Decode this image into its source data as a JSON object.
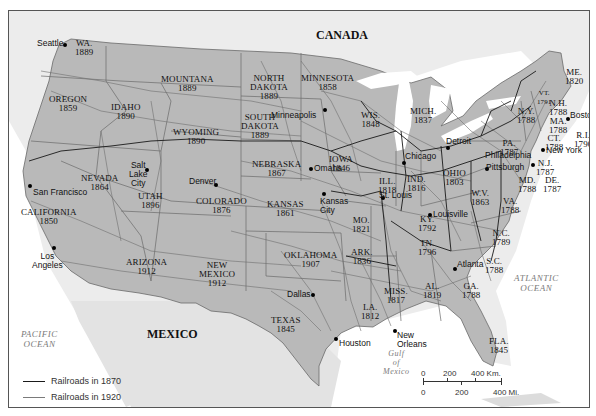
{
  "map": {
    "countries": {
      "canada": "CANADA",
      "mexico": "MEXICO"
    },
    "oceans": {
      "pacific": "PACIFIC\nOCEAN",
      "atlantic": "ATLANTIC\nOCEAN",
      "gulf": "Gulf\nof\nMexico"
    },
    "states": [
      {
        "id": "wa",
        "name": "WA.",
        "year": "1889"
      },
      {
        "id": "oregon",
        "name": "OREGON",
        "year": "1859"
      },
      {
        "id": "idaho",
        "name": "IDAHO",
        "year": "1890"
      },
      {
        "id": "montana",
        "name": "MOUNTANA",
        "year": "1889"
      },
      {
        "id": "wyoming",
        "name": "WYOMING",
        "year": "1890"
      },
      {
        "id": "north-dakota",
        "name": "NORTH\nDAKOTA",
        "year": "1889"
      },
      {
        "id": "south-dakota",
        "name": "SOUTH\nDAKOTA",
        "year": "1889"
      },
      {
        "id": "minnesota",
        "name": "MINNESOTA",
        "year": "1858"
      },
      {
        "id": "wisconsin",
        "name": "WIS.",
        "year": "1848"
      },
      {
        "id": "michigan",
        "name": "MICH.",
        "year": "1837"
      },
      {
        "id": "nevada",
        "name": "NEVADA",
        "year": "1864"
      },
      {
        "id": "utah",
        "name": "UTAH",
        "year": "1896"
      },
      {
        "id": "california",
        "name": "CALIFORNIA",
        "year": "1850"
      },
      {
        "id": "colorado",
        "name": "COLORADO",
        "year": "1876"
      },
      {
        "id": "nebraska",
        "name": "NEBRASKA",
        "year": "1867"
      },
      {
        "id": "iowa",
        "name": "IOWA",
        "year": "1846"
      },
      {
        "id": "kansas",
        "name": "KANSAS",
        "year": "1861"
      },
      {
        "id": "illinois",
        "name": "ILL.",
        "year": "1818"
      },
      {
        "id": "indiana",
        "name": "IND.",
        "year": "1816"
      },
      {
        "id": "ohio",
        "name": "OHIO",
        "year": "1803"
      },
      {
        "id": "missouri",
        "name": "MO.",
        "year": "1821"
      },
      {
        "id": "arizona",
        "name": "ARIZONA",
        "year": "1912"
      },
      {
        "id": "new-mexico",
        "name": "NEW\nMEXICO",
        "year": "1912"
      },
      {
        "id": "oklahoma",
        "name": "OKLAHOMA",
        "year": "1907"
      },
      {
        "id": "arkansas",
        "name": "ARK.",
        "year": "1836"
      },
      {
        "id": "texas",
        "name": "TEXAS",
        "year": "1845"
      },
      {
        "id": "louisiana",
        "name": "LA.",
        "year": "1812"
      },
      {
        "id": "mississippi",
        "name": "MISS.",
        "year": "1817"
      },
      {
        "id": "alabama",
        "name": "AL.",
        "year": "1819"
      },
      {
        "id": "georgia",
        "name": "GA.",
        "year": "1788"
      },
      {
        "id": "florida",
        "name": "FLA.",
        "year": "1845"
      },
      {
        "id": "kentucky",
        "name": "KY.",
        "year": "1792"
      },
      {
        "id": "tennessee",
        "name": "TN.",
        "year": "1796"
      },
      {
        "id": "west-virginia",
        "name": "W.V.",
        "year": "1863"
      },
      {
        "id": "virginia",
        "name": "VA.",
        "year": "1788"
      },
      {
        "id": "north-carolina",
        "name": "N.C.",
        "year": "1789"
      },
      {
        "id": "south-carolina",
        "name": "S.C.",
        "year": "1788"
      },
      {
        "id": "pennsylvania",
        "name": "PA.",
        "year": "1787"
      },
      {
        "id": "new-york",
        "name": "N.Y.",
        "year": "1788"
      },
      {
        "id": "vermont",
        "name": "VT.",
        "year": "1791"
      },
      {
        "id": "new-hampshire",
        "name": "N.H.",
        "year": "1788"
      },
      {
        "id": "maine",
        "name": "ME.",
        "year": "1820"
      },
      {
        "id": "massachusetts",
        "name": "MA.",
        "year": "1788"
      },
      {
        "id": "connecticut",
        "name": "CT.",
        "year": "1788"
      },
      {
        "id": "rhode-island",
        "name": "R.I.",
        "year": "1790"
      },
      {
        "id": "new-jersey",
        "name": "N.J.",
        "year": "1787"
      },
      {
        "id": "maryland",
        "name": "MD.",
        "year": "1788"
      },
      {
        "id": "delaware",
        "name": "DE.",
        "year": "1787"
      }
    ],
    "cities": [
      "Seattle",
      "San Francisco",
      "Los Angeles",
      "Salt Lake City",
      "Denver",
      "Minneapolis",
      "Omaha",
      "Kansas City",
      "St. Louis",
      "Chicago",
      "Detroit",
      "Louisville",
      "Pittsburgh",
      "Philadelphia",
      "New York",
      "Boston",
      "Atlanta",
      "Dallas",
      "Houston",
      "New Orleans"
    ],
    "city_labels": {
      "seattle": "Seattle",
      "san_francisco": "San Francisco",
      "los_angeles": "Los\nAngeles",
      "salt_lake_city": "Salt\nLake\nCity",
      "denver": "Denver",
      "minneapolis": "Minneapolis",
      "omaha": "Omaha",
      "kansas_city": "Kansas\nCity",
      "st_louis": "St. Louis",
      "chicago": "Chicago",
      "detroit": "Detroit",
      "louisville": "Louisville",
      "pittsburgh": "Pittsburgh",
      "philadelphia": "Philadelphia",
      "new_york": "New York",
      "boston": "Boston",
      "atlanta": "Atlanta",
      "dallas": "Dallas",
      "houston": "Houston",
      "new_orleans": "New\nOrleans"
    },
    "legend": {
      "items": [
        {
          "label": "Railroads in 1870",
          "color": "#1a1a1a"
        },
        {
          "label": "Railroads in 1920",
          "color": "#7a7a7a"
        }
      ]
    },
    "scale_bar": {
      "km_ticks": [
        "0",
        "200",
        "400 Km."
      ],
      "mi_ticks": [
        "0",
        "200",
        "400 Mi."
      ]
    },
    "colors": {
      "us_land": "#b9b9b9",
      "foreign_land": "#e6e6e6",
      "water": "#ffffff",
      "rail_1870": "#1a1a1a",
      "rail_1920": "#6e6e6e",
      "state_border": "#6a6a6a"
    }
  }
}
